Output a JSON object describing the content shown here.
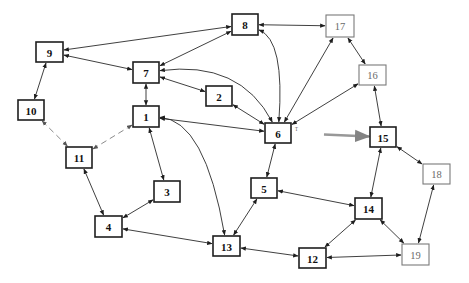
{
  "diagram": {
    "type": "directed-network",
    "nodes": [
      {
        "id": "1",
        "label": "1",
        "style": "primary"
      },
      {
        "id": "2",
        "label": "2",
        "style": "primary"
      },
      {
        "id": "3",
        "label": "3",
        "style": "primary"
      },
      {
        "id": "4",
        "label": "4",
        "style": "primary"
      },
      {
        "id": "5",
        "label": "5",
        "style": "primary"
      },
      {
        "id": "6",
        "label": "6",
        "style": "primary"
      },
      {
        "id": "7",
        "label": "7",
        "style": "primary"
      },
      {
        "id": "8",
        "label": "8",
        "style": "primary"
      },
      {
        "id": "9",
        "label": "9",
        "style": "primary"
      },
      {
        "id": "10",
        "label": "10",
        "style": "primary"
      },
      {
        "id": "11",
        "label": "11",
        "style": "primary"
      },
      {
        "id": "12",
        "label": "12",
        "style": "primary"
      },
      {
        "id": "13",
        "label": "13",
        "style": "primary"
      },
      {
        "id": "14",
        "label": "14",
        "style": "primary"
      },
      {
        "id": "15",
        "label": "15",
        "style": "primary"
      },
      {
        "id": "16",
        "label": "16",
        "style": "secondary"
      },
      {
        "id": "17",
        "label": "17",
        "style": "secondary"
      },
      {
        "id": "18",
        "label": "18",
        "style": "secondary"
      },
      {
        "id": "19",
        "label": "19",
        "style": "secondary"
      }
    ],
    "edges": [
      {
        "from": "9",
        "to": "8",
        "direction": "both"
      },
      {
        "from": "7",
        "to": "8",
        "direction": "both"
      },
      {
        "from": "9",
        "to": "7",
        "direction": "both"
      },
      {
        "from": "9",
        "to": "10",
        "direction": "both"
      },
      {
        "from": "7",
        "to": "1",
        "direction": "both"
      },
      {
        "from": "7",
        "to": "2",
        "direction": "both"
      },
      {
        "from": "7",
        "to": "6",
        "direction": "both",
        "shape": "curved"
      },
      {
        "from": "8",
        "to": "17",
        "direction": "both"
      },
      {
        "from": "8",
        "to": "6",
        "direction": "both",
        "shape": "curved"
      },
      {
        "from": "2",
        "to": "6",
        "direction": "both"
      },
      {
        "from": "1",
        "to": "6",
        "direction": "both"
      },
      {
        "from": "1",
        "to": "13",
        "direction": "both",
        "shape": "curved"
      },
      {
        "from": "1",
        "to": "3",
        "direction": "both"
      },
      {
        "from": "1",
        "to": "11",
        "direction": "both",
        "shape": "faded"
      },
      {
        "from": "10",
        "to": "11",
        "direction": "both",
        "shape": "faded"
      },
      {
        "from": "11",
        "to": "4",
        "direction": "both"
      },
      {
        "from": "3",
        "to": "4",
        "direction": "both"
      },
      {
        "from": "4",
        "to": "13",
        "direction": "both"
      },
      {
        "from": "6",
        "to": "17",
        "direction": "both"
      },
      {
        "from": "6",
        "to": "16",
        "direction": "both"
      },
      {
        "from": "6",
        "to": "15",
        "direction": "forward",
        "shape": "blur"
      },
      {
        "from": "6",
        "to": "5",
        "direction": "both"
      },
      {
        "from": "17",
        "to": "16",
        "direction": "both"
      },
      {
        "from": "16",
        "to": "15",
        "direction": "both"
      },
      {
        "from": "15",
        "to": "18",
        "direction": "both"
      },
      {
        "from": "15",
        "to": "14",
        "direction": "both"
      },
      {
        "from": "5",
        "to": "14",
        "direction": "both"
      },
      {
        "from": "5",
        "to": "13",
        "direction": "both"
      },
      {
        "from": "13",
        "to": "12",
        "direction": "both"
      },
      {
        "from": "12",
        "to": "14",
        "direction": "both"
      },
      {
        "from": "12",
        "to": "19",
        "direction": "both"
      },
      {
        "from": "14",
        "to": "19",
        "direction": "both"
      },
      {
        "from": "18",
        "to": "19",
        "direction": "both"
      }
    ],
    "annotations": [
      {
        "near": "6",
        "text": "ᵀ"
      }
    ]
  }
}
